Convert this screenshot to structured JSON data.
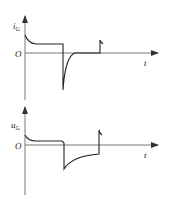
{
  "figure": {
    "colors": {
      "line": "#222222",
      "axis": "#555555",
      "background": "#ffffff"
    },
    "plots": [
      {
        "name": "gate-current",
        "y_label": "i",
        "y_label_sub": "G",
        "x_label": "t",
        "origin_label": "O",
        "description": "Gate current waveform: positive decaying pulse at turn-on, constant level, large negative spike at turn-off recovering to zero, small positive spike later"
      },
      {
        "name": "gate-voltage",
        "y_label": "u",
        "y_label_sub": "G",
        "x_label": "t",
        "origin_label": "O",
        "description": "Gate voltage waveform: positive decaying level, negative step at turn-off rising exponentially, step back up with small spike"
      }
    ]
  }
}
